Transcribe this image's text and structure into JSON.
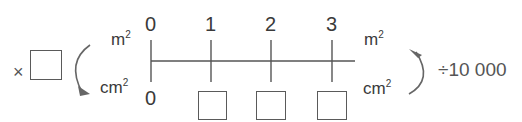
{
  "diagram": {
    "type": "double number line",
    "left_operation": {
      "symbol": "×",
      "blank": true
    },
    "right_operation": {
      "label": "÷10 000"
    },
    "top_unit": {
      "base": "m",
      "exp": "2"
    },
    "bottom_unit": {
      "base": "cm",
      "exp": "2"
    },
    "top_values": [
      "0",
      "1",
      "2",
      "3"
    ],
    "bottom_values": [
      "0",
      "",
      "",
      ""
    ],
    "bottom_blanks": 3
  },
  "colors": {
    "ink": "#3a3a3a",
    "line": "#555555",
    "arrow": "#666666"
  }
}
